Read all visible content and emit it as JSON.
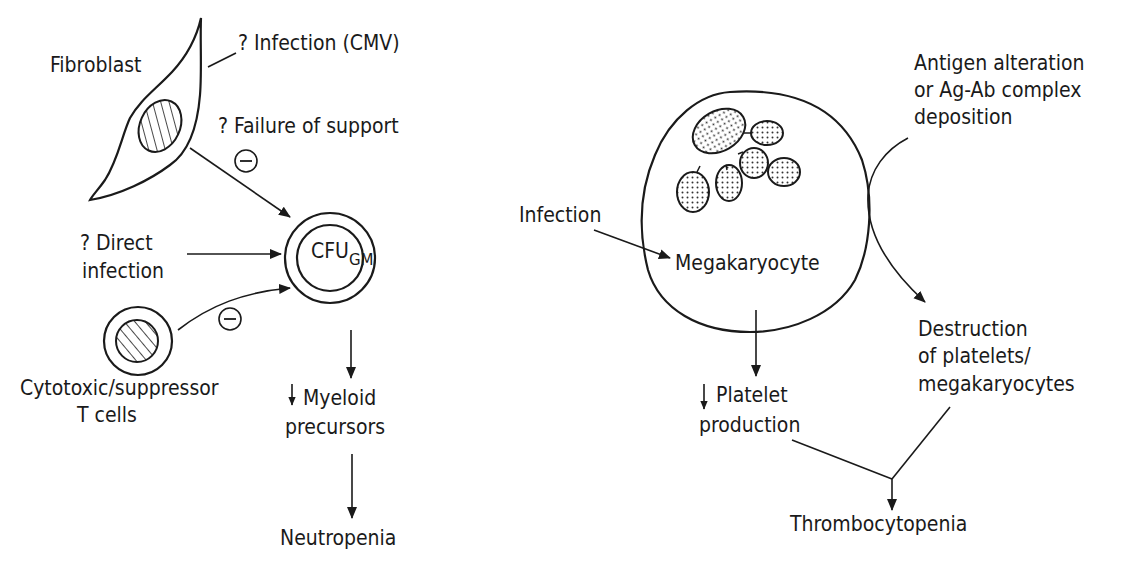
{
  "left_panel": {
    "fibroblast": "Fibroblast",
    "infection_cmv": "? Infection (CMV)",
    "failure_support": "? Failure of support",
    "direct_infection_1": "? Direct",
    "direct_infection_2": "infection",
    "cfu_main": "CFU",
    "cfu_sub": "GM",
    "tcells_1": "Cytotoxic/suppressor",
    "tcells_2": "T cells",
    "myeloid_1": "Myeloid",
    "myeloid_2": "precursors",
    "neutropenia": "Neutropenia",
    "inhibit_symbol": "−",
    "decrease_symbol": "↓"
  },
  "right_panel": {
    "infection": "Infection",
    "megakaryocyte": "Megakaryocyte",
    "antigen_1": "Antigen alteration",
    "antigen_2": "or Ag-Ab complex",
    "antigen_3": "deposition",
    "destruction_1": "Destruction",
    "destruction_2": "of platelets/",
    "destruction_3": "megakaryocytes",
    "platelet_1": "Platelet",
    "platelet_2": "production",
    "thrombocytopenia": "Thrombocytopenia",
    "decrease_symbol": "↓"
  },
  "colors": {
    "ink": "#1a1a1a",
    "background": "#ffffff"
  }
}
